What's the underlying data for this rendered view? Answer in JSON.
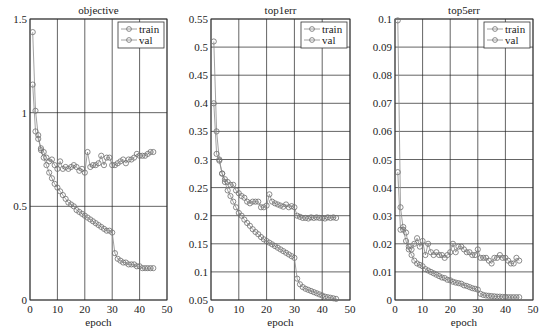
{
  "chart_data": [
    {
      "type": "line",
      "title": "objective",
      "xlabel": "epoch",
      "ylabel": "",
      "xlim": [
        0,
        50
      ],
      "ylim": [
        0,
        1.5
      ],
      "xticks": [
        0,
        10,
        20,
        30,
        40,
        50
      ],
      "yticks": [
        0,
        0.5,
        1,
        1.5
      ],
      "ytick_labels": [
        "0",
        "0.5",
        "1",
        "1.5"
      ],
      "grid": true,
      "legend_position": "upper right",
      "box": {
        "left": 30,
        "top": 19,
        "right": 167,
        "bottom": 300
      },
      "x": [
        1,
        2,
        3,
        4,
        5,
        6,
        7,
        8,
        9,
        10,
        11,
        12,
        13,
        14,
        15,
        16,
        17,
        18,
        19,
        20,
        21,
        22,
        23,
        24,
        25,
        26,
        27,
        28,
        29,
        30,
        31,
        32,
        33,
        34,
        35,
        36,
        37,
        38,
        39,
        40,
        41,
        42,
        43,
        44,
        45
      ],
      "series": [
        {
          "name": "train",
          "values": [
            1.43,
            1.01,
            0.88,
            0.8,
            0.76,
            0.72,
            0.68,
            0.65,
            0.62,
            0.6,
            0.58,
            0.56,
            0.54,
            0.52,
            0.51,
            0.5,
            0.48,
            0.47,
            0.46,
            0.45,
            0.44,
            0.43,
            0.42,
            0.41,
            0.4,
            0.39,
            0.38,
            0.37,
            0.37,
            0.36,
            0.25,
            0.22,
            0.21,
            0.2,
            0.2,
            0.19,
            0.19,
            0.19,
            0.18,
            0.18,
            0.17,
            0.17,
            0.17,
            0.17,
            0.17
          ]
        },
        {
          "name": "val",
          "values": [
            1.15,
            0.9,
            0.86,
            0.81,
            0.79,
            0.76,
            0.74,
            0.75,
            0.72,
            0.7,
            0.74,
            0.7,
            0.71,
            0.7,
            0.71,
            0.72,
            0.71,
            0.69,
            0.7,
            0.68,
            0.79,
            0.71,
            0.72,
            0.72,
            0.73,
            0.77,
            0.72,
            0.76,
            0.76,
            0.72,
            0.72,
            0.73,
            0.74,
            0.75,
            0.73,
            0.75,
            0.75,
            0.76,
            0.78,
            0.77,
            0.77,
            0.77,
            0.78,
            0.79,
            0.79
          ]
        }
      ]
    },
    {
      "type": "line",
      "title": "top1err",
      "xlabel": "epoch",
      "ylabel": "",
      "xlim": [
        0,
        50
      ],
      "ylim": [
        0.05,
        0.55
      ],
      "xticks": [
        0,
        10,
        20,
        30,
        40,
        50
      ],
      "yticks": [
        0.05,
        0.1,
        0.15,
        0.2,
        0.25,
        0.3,
        0.35,
        0.4,
        0.45,
        0.5,
        0.55
      ],
      "ytick_labels": [
        "0.05",
        "0.1",
        "0.15",
        "0.2",
        "0.25",
        "0.3",
        "0.35",
        "0.4",
        "0.45",
        "0.5",
        "0.55"
      ],
      "grid": true,
      "legend_position": "upper right",
      "box": {
        "left": 211,
        "top": 19,
        "right": 350,
        "bottom": 300
      },
      "x": [
        1,
        2,
        3,
        4,
        5,
        6,
        7,
        8,
        9,
        10,
        11,
        12,
        13,
        14,
        15,
        16,
        17,
        18,
        19,
        20,
        21,
        22,
        23,
        24,
        25,
        26,
        27,
        28,
        29,
        30,
        31,
        32,
        33,
        34,
        35,
        36,
        37,
        38,
        39,
        40,
        41,
        42,
        43,
        44,
        45
      ],
      "series": [
        {
          "name": "train",
          "values": [
            0.51,
            0.35,
            0.3,
            0.275,
            0.26,
            0.245,
            0.235,
            0.225,
            0.215,
            0.205,
            0.2,
            0.193,
            0.187,
            0.182,
            0.176,
            0.171,
            0.167,
            0.162,
            0.158,
            0.155,
            0.152,
            0.149,
            0.146,
            0.143,
            0.14,
            0.137,
            0.134,
            0.131,
            0.128,
            0.125,
            0.088,
            0.078,
            0.073,
            0.07,
            0.068,
            0.066,
            0.064,
            0.062,
            0.06,
            0.058,
            0.056,
            0.055,
            0.054,
            0.053,
            0.052
          ]
        },
        {
          "name": "val",
          "values": [
            0.4,
            0.31,
            0.298,
            0.275,
            0.265,
            0.26,
            0.255,
            0.255,
            0.245,
            0.24,
            0.235,
            0.232,
            0.225,
            0.222,
            0.225,
            0.225,
            0.225,
            0.215,
            0.215,
            0.218,
            0.238,
            0.225,
            0.222,
            0.22,
            0.218,
            0.216,
            0.22,
            0.215,
            0.217,
            0.215,
            0.2,
            0.198,
            0.196,
            0.196,
            0.195,
            0.197,
            0.196,
            0.197,
            0.196,
            0.196,
            0.195,
            0.197,
            0.196,
            0.197,
            0.196
          ]
        }
      ]
    },
    {
      "type": "line",
      "title": "top5err",
      "xlabel": "epoch",
      "ylabel": "",
      "xlim": [
        0,
        50
      ],
      "ylim": [
        0,
        0.1
      ],
      "xticks": [
        0,
        10,
        20,
        30,
        40,
        50
      ],
      "yticks": [
        0,
        0.01,
        0.02,
        0.03,
        0.04,
        0.05,
        0.06,
        0.07,
        0.08,
        0.09,
        0.1
      ],
      "ytick_labels": [
        "0",
        "0.01",
        "0.02",
        "0.03",
        "0.04",
        "0.05",
        "0.06",
        "0.07",
        "0.08",
        "0.09",
        "0.1"
      ],
      "grid": true,
      "legend_position": "upper right",
      "box": {
        "left": 395,
        "top": 19,
        "right": 533,
        "bottom": 300
      },
      "x": [
        1,
        2,
        3,
        4,
        5,
        6,
        7,
        8,
        9,
        10,
        11,
        12,
        13,
        14,
        15,
        16,
        17,
        18,
        19,
        20,
        21,
        22,
        23,
        24,
        25,
        26,
        27,
        28,
        29,
        30,
        31,
        32,
        33,
        34,
        35,
        36,
        37,
        38,
        39,
        40,
        41,
        42,
        43,
        44,
        45
      ],
      "series": [
        {
          "name": "train",
          "values": [
            0.0995,
            0.033,
            0.025,
            0.021,
            0.018,
            0.016,
            0.014,
            0.013,
            0.0125,
            0.012,
            0.011,
            0.0105,
            0.01,
            0.0095,
            0.009,
            0.0085,
            0.008,
            0.0078,
            0.0072,
            0.007,
            0.0065,
            0.0062,
            0.006,
            0.0058,
            0.0052,
            0.005,
            0.0046,
            0.0042,
            0.004,
            0.0037,
            0.0022,
            0.0018,
            0.0016,
            0.0015,
            0.0014,
            0.0013,
            0.0012,
            0.0012,
            0.0011,
            0.0011,
            0.001,
            0.001,
            0.001,
            0.001,
            0.001
          ]
        },
        {
          "name": "val",
          "values": [
            0.0455,
            0.025,
            0.026,
            0.024,
            0.019,
            0.018,
            0.02,
            0.022,
            0.019,
            0.021,
            0.016,
            0.02,
            0.017,
            0.016,
            0.017,
            0.016,
            0.016,
            0.015,
            0.016,
            0.017,
            0.02,
            0.017,
            0.019,
            0.019,
            0.018,
            0.017,
            0.017,
            0.016,
            0.016,
            0.018,
            0.015,
            0.015,
            0.015,
            0.014,
            0.013,
            0.015,
            0.015,
            0.016,
            0.015,
            0.015,
            0.014,
            0.013,
            0.013,
            0.015,
            0.014
          ]
        }
      ]
    }
  ],
  "legend": {
    "train_label": "train",
    "val_label": "val"
  },
  "style": {
    "line_color": "#8a8a8a",
    "marker_color": "#6e6e6e",
    "grid_color": "#222222",
    "axis_color": "#333333"
  }
}
